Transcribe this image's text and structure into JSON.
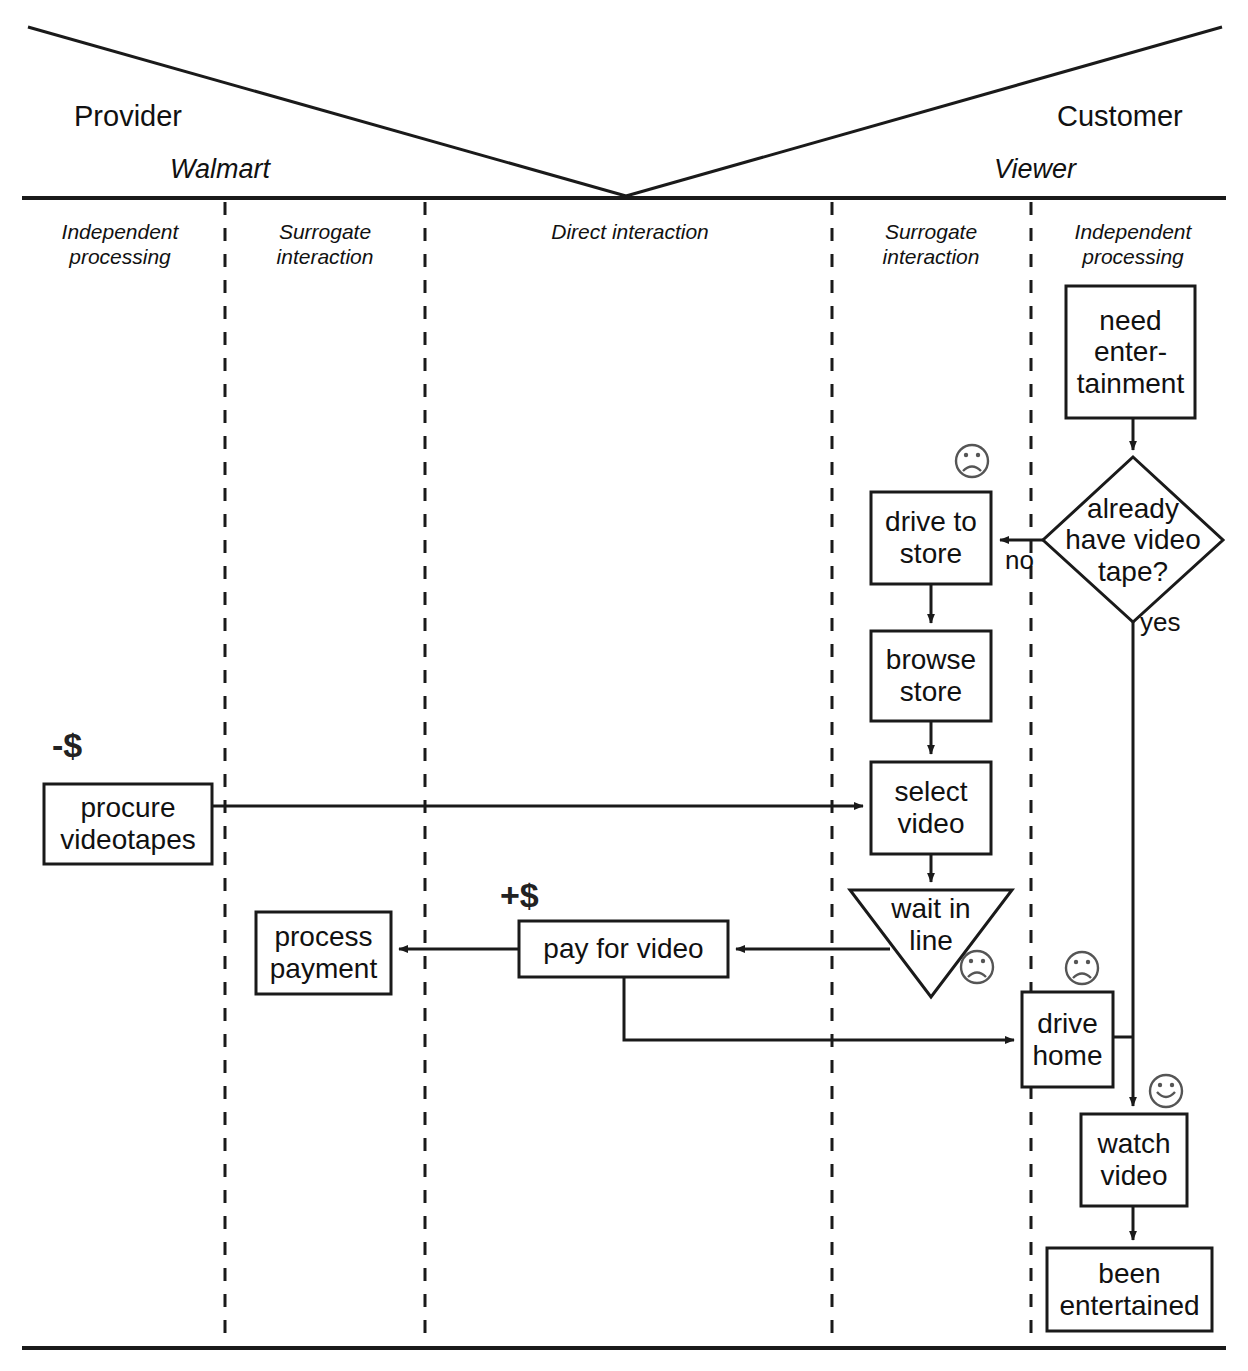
{
  "diagram": {
    "type": "service-blueprint-flowchart",
    "line_color": "#1a1a1a",
    "background": "#ffffff"
  },
  "header": {
    "provider_role": "Provider",
    "customer_role": "Customer",
    "provider_actor": "Walmart",
    "customer_actor": "Viewer"
  },
  "zones": [
    {
      "id": "provider-independent",
      "label": "Independent\nprocessing"
    },
    {
      "id": "provider-surrogate",
      "label": "Surrogate\ninteraction"
    },
    {
      "id": "direct",
      "label": "Direct interaction"
    },
    {
      "id": "customer-surrogate",
      "label": "Surrogate\ninteraction"
    },
    {
      "id": "customer-independent",
      "label": "Independent\nprocessing"
    }
  ],
  "nodes": [
    {
      "id": "need-entertainment",
      "shape": "rect",
      "label": "need\nenter-\ntainment",
      "zone": "customer-independent"
    },
    {
      "id": "have-tape",
      "shape": "diamond",
      "label": "already\nhave video\ntape?",
      "zone": "customer-independent"
    },
    {
      "id": "drive-to-store",
      "shape": "rect",
      "label": "drive to\nstore",
      "zone": "customer-surrogate",
      "emotion": "sad"
    },
    {
      "id": "browse-store",
      "shape": "rect",
      "label": "browse\nstore",
      "zone": "customer-surrogate"
    },
    {
      "id": "select-video",
      "shape": "rect",
      "label": "select\nvideo",
      "zone": "customer-surrogate"
    },
    {
      "id": "wait-in-line",
      "shape": "triangle",
      "label": "wait in\nline",
      "zone": "customer-surrogate",
      "emotion": "sad"
    },
    {
      "id": "drive-home",
      "shape": "rect",
      "label": "drive\nhome",
      "zone": "customer-independent",
      "emotion": "sad"
    },
    {
      "id": "watch-video",
      "shape": "rect",
      "label": "watch\nvideo",
      "zone": "customer-independent",
      "emotion": "happy"
    },
    {
      "id": "been-entertained",
      "shape": "rect",
      "label": "been\nentertained",
      "zone": "customer-independent"
    },
    {
      "id": "pay-for-video",
      "shape": "rect",
      "label": "pay for video",
      "zone": "direct"
    },
    {
      "id": "process-payment",
      "shape": "rect",
      "label": "process\npayment",
      "zone": "provider-surrogate"
    },
    {
      "id": "procure-videotapes",
      "shape": "rect",
      "label": "procure\nvideotapes",
      "zone": "provider-independent"
    }
  ],
  "edges": [
    {
      "from": "need-entertainment",
      "to": "have-tape",
      "label": ""
    },
    {
      "from": "have-tape",
      "to": "drive-to-store",
      "label": "no"
    },
    {
      "from": "have-tape",
      "to": "drive-home",
      "label": "yes"
    },
    {
      "from": "drive-to-store",
      "to": "browse-store",
      "label": ""
    },
    {
      "from": "browse-store",
      "to": "select-video",
      "label": ""
    },
    {
      "from": "select-video",
      "to": "wait-in-line",
      "label": ""
    },
    {
      "from": "wait-in-line",
      "to": "pay-for-video",
      "label": ""
    },
    {
      "from": "pay-for-video",
      "to": "process-payment",
      "label": ""
    },
    {
      "from": "pay-for-video",
      "to": "drive-home",
      "label": ""
    },
    {
      "from": "procure-videotapes",
      "to": "select-video",
      "label": ""
    },
    {
      "from": "drive-home",
      "to": "watch-video",
      "label": ""
    },
    {
      "from": "watch-video",
      "to": "been-entertained",
      "label": ""
    }
  ],
  "annotations": [
    {
      "id": "cost-label",
      "text": "-$",
      "near": "procure-videotapes"
    },
    {
      "id": "revenue-label",
      "text": "+$",
      "near": "pay-for-video"
    }
  ],
  "edge_labels": {
    "no": "no",
    "yes": "yes"
  },
  "emotion_icons": {
    "sad": "frowning-face-icon",
    "happy": "smiling-face-icon"
  }
}
